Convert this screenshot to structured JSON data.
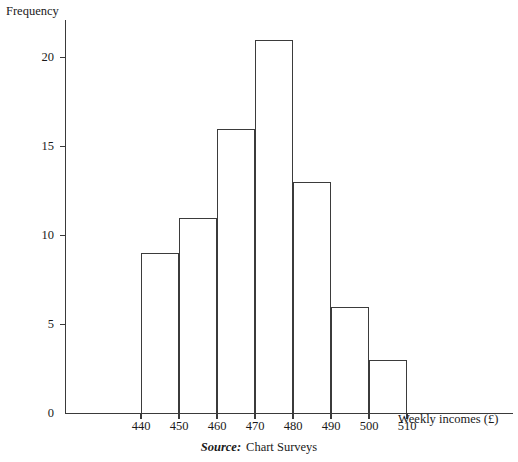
{
  "chart_data": {
    "type": "bar",
    "title": "",
    "subtitle": "",
    "xlabel": "Weekly incomes (£)",
    "ylabel": "Frequency",
    "grid": false,
    "legend": "none",
    "bin_width": 10,
    "bin_edges": [
      440,
      450,
      460,
      470,
      480,
      490,
      500,
      510
    ],
    "categories": [
      "440-450",
      "450-460",
      "460-470",
      "470-480",
      "480-490",
      "490-500",
      "500-510"
    ],
    "values": [
      9,
      11,
      16,
      21,
      13,
      6,
      3
    ],
    "xlim": [
      430,
      540
    ],
    "ylim": [
      0,
      22.5
    ],
    "xticks": [
      440,
      450,
      460,
      470,
      480,
      490,
      500,
      510
    ],
    "yticks": [
      0,
      5,
      10,
      15,
      20
    ],
    "xtick_labels": [
      "440",
      "450",
      "460",
      "470",
      "480",
      "490",
      "500",
      "510"
    ],
    "ytick_labels": [
      "0",
      "5",
      "10",
      "15",
      "20"
    ],
    "bar_fill": "#ffffff",
    "bar_edge": "#3b3b3b",
    "axis_color": "#3a3a3a"
  },
  "caption": {
    "source_word": "Source:",
    "source_value": "Chart Surveys"
  }
}
